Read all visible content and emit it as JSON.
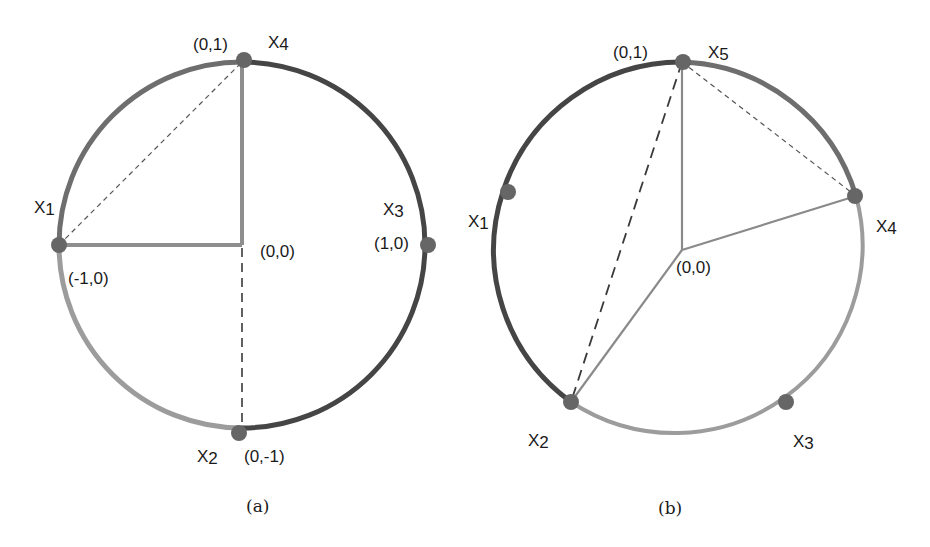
{
  "colors": {
    "arc_dark": "#454545",
    "arc_medium": "#6e6e6e",
    "arc_light": "#9c9c9c",
    "point": "#666666",
    "radius_a": "#8e8e8e",
    "radius_b": "#8a8a8a",
    "dash": "#3a3a3a"
  },
  "figures": [
    {
      "id": "a",
      "caption": "(a)",
      "center": {
        "x": 242,
        "y": 245,
        "label": "(0,0)"
      },
      "radius": 183,
      "points": [
        {
          "name": "X",
          "sub": "1",
          "coord": "(-1,0)",
          "angle_deg": 180
        },
        {
          "name": "X",
          "sub": "2",
          "coord": "(0,-1)",
          "angle_deg": 270
        },
        {
          "name": "X",
          "sub": "3",
          "coord": "(1,0)",
          "angle_deg": 0
        },
        {
          "name": "X",
          "sub": "4",
          "coord": "(0,1)",
          "angle_deg": 90
        }
      ],
      "arcs": [
        {
          "from": "X1",
          "to": "X4",
          "shade": "medium"
        },
        {
          "from": "X4",
          "to": "X2",
          "via": "X3",
          "shade": "dark"
        },
        {
          "from": "X2",
          "to": "X1",
          "shade": "light"
        }
      ],
      "segments": [
        {
          "from": "O",
          "to": "X4",
          "style": "solid"
        },
        {
          "from": "O",
          "to": "X1",
          "style": "solid"
        },
        {
          "from": "X1",
          "to": "X4",
          "style": "dashed-thin"
        },
        {
          "from": "O",
          "to": "X2",
          "style": "dashed"
        }
      ]
    },
    {
      "id": "b",
      "caption": "(b)",
      "center": {
        "x": 682,
        "y": 250,
        "label": "(0,0)"
      },
      "radius": 188,
      "points": [
        {
          "name": "X",
          "sub": "1",
          "coord": "",
          "angle_deg": 162
        },
        {
          "name": "X",
          "sub": "2",
          "coord": "",
          "angle_deg": 236
        },
        {
          "name": "X",
          "sub": "3",
          "coord": "",
          "angle_deg": 306
        },
        {
          "name": "X",
          "sub": "4",
          "coord": "",
          "angle_deg": 18
        },
        {
          "name": "X",
          "sub": "5",
          "coord": "(0,1)",
          "angle_deg": 90
        }
      ],
      "arcs": [
        {
          "from": "X2",
          "to": "X5",
          "via": "X1",
          "shade": "dark"
        },
        {
          "from": "X5",
          "to": "X4",
          "shade": "medium"
        },
        {
          "from": "X4",
          "to": "X2",
          "via": "X3",
          "shade": "light"
        }
      ],
      "segments": [
        {
          "from": "O",
          "to": "X5",
          "style": "solid-thin"
        },
        {
          "from": "O",
          "to": "X4",
          "style": "solid-thin"
        },
        {
          "from": "O",
          "to": "X2",
          "style": "solid-thin"
        },
        {
          "from": "X5",
          "to": "X2",
          "style": "dashed"
        },
        {
          "from": "X5",
          "to": "X4",
          "style": "dashed-thin"
        }
      ]
    }
  ]
}
